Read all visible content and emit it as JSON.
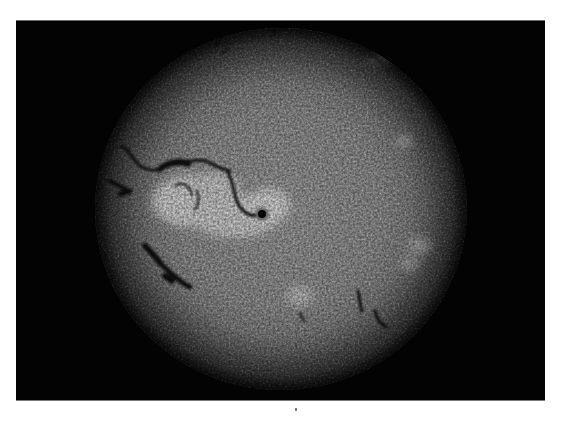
{
  "image": {
    "subject": "H-alpha full solar disk photograph",
    "background_color": "#ffffff",
    "frame_color": "#030303",
    "disk": {
      "center_x": 281,
      "center_y": 208,
      "radius_x": 186,
      "radius_y": 181,
      "base_color": "#8c8c8c",
      "limb_color": "#2a2a2a"
    },
    "features": {
      "active_region_plage": "bright plage region left-center with sunspot",
      "sunspot": "dark umbra at approx (262, 213)",
      "filaments": [
        "long sinuous filament upper-left from (122,146) to (230,170)",
        "filament through plage ending at sunspot",
        "dark filament segments lower-left near (150,250)-(185,285)",
        "small filaments lower-right near (360,300) and (378,320)",
        "small filaments near top limb"
      ]
    }
  }
}
